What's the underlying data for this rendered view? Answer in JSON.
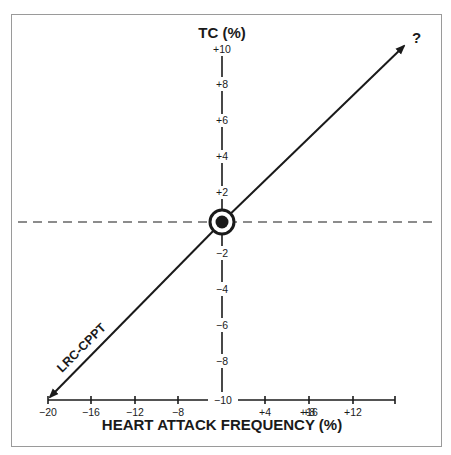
{
  "chart_data": {
    "type": "line",
    "title": "",
    "xlabel": "HEART ATTACK FREQUENCY (%)",
    "ylabel": "TC (%)",
    "xlim": [
      -20,
      20
    ],
    "ylim": [
      -10,
      10
    ],
    "x_ticks": [
      "-20",
      "-16",
      "-12",
      "-8",
      "-4",
      "+4",
      "+8",
      "+12",
      "+16",
      "+20"
    ],
    "y_ticks": [
      "+10",
      "+8",
      "+6",
      "+4",
      "+2",
      "-2",
      "-4",
      "-6",
      "-8",
      "-10"
    ],
    "series": [
      {
        "name": "LRC-CPPT",
        "x": [
          -20,
          20
        ],
        "y": [
          -10,
          10
        ],
        "arrow_both_ends": true
      }
    ],
    "reference_lines": [
      {
        "orientation": "horizontal",
        "y": 0,
        "style": "dashed"
      }
    ],
    "origin_marker": "bullseye",
    "annotations": [
      {
        "text": "LRC-CPPT",
        "position": "lower-left along line"
      },
      {
        "text": "?",
        "position": "upper-right arrow tip"
      }
    ],
    "grid": false,
    "legend": "none"
  },
  "labels": {
    "y_title": "TC (%)",
    "x_title": "HEART ATTACK FREQUENCY (%)",
    "line_label": "LRC-CPPT",
    "question": "?",
    "y_ticks": {
      "p10": "+10",
      "p8": "+8",
      "p6": "+6",
      "p4": "+4",
      "p2": "+2",
      "m2": "−2",
      "m4": "−4",
      "m6": "−6",
      "m8": "−8",
      "m10": "−10"
    },
    "x_ticks": {
      "m20": "−20",
      "m16": "−16",
      "m12": "−12",
      "m8": "−8",
      "m4": "−4",
      "p4": "+4",
      "p8": "+8",
      "p12": "+12",
      "p16": "+16",
      "p20": "+20"
    }
  }
}
